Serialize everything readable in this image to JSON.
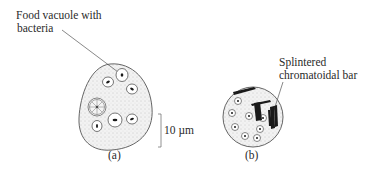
{
  "diagram": {
    "panel_a": {
      "caption": "(a)",
      "callout_line1": "Food vacuole with",
      "callout_line2": "bacteria",
      "scale_bar_label": "10 µm"
    },
    "panel_b": {
      "caption": "(b)",
      "callout_line1": "Splintered",
      "callout_line2": "chromatoidal bar"
    },
    "colors": {
      "outline": "#555555",
      "stipple": "#e6e6e6",
      "ink": "#1a1a1a"
    }
  }
}
